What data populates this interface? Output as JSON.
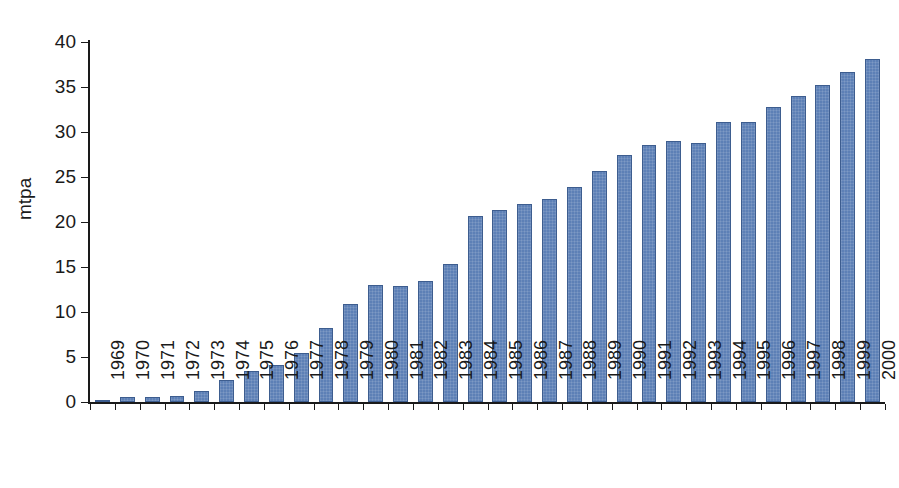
{
  "chart_data": {
    "type": "bar",
    "title": "",
    "subtitle": "",
    "xlabel": "",
    "ylabel": "mtpa",
    "ylim": [
      0,
      40
    ],
    "yticks": [
      0,
      5,
      10,
      15,
      20,
      25,
      30,
      35,
      40
    ],
    "ytick_labels": [
      "0",
      "5",
      "10",
      "15",
      "20",
      "25",
      "30",
      "35",
      "40"
    ],
    "grid": false,
    "legend": null,
    "legend_position": "none",
    "bar_color": "#5d80b6",
    "bar_edge_color": "#3d5d8f",
    "axis_color": "#1a1a1a",
    "background_color": "#ffffff",
    "categories": [
      "1969",
      "1970",
      "1971",
      "1972",
      "1973",
      "1974",
      "1975",
      "1976",
      "1977",
      "1978",
      "1979",
      "1980",
      "1981",
      "1982",
      "1983",
      "1984",
      "1985",
      "1986",
      "1987",
      "1988",
      "1989",
      "1990",
      "1991",
      "1992",
      "1993",
      "1994",
      "1995",
      "1996",
      "1997",
      "1998",
      "1999",
      "2000"
    ],
    "values": [
      0.2,
      0.6,
      0.6,
      0.7,
      1.2,
      2.5,
      3.4,
      4.1,
      5.5,
      8.2,
      10.9,
      13.0,
      12.9,
      13.4,
      15.3,
      20.7,
      21.3,
      22.0,
      22.6,
      23.9,
      25.7,
      27.4,
      28.6,
      29.0,
      28.8,
      31.1,
      31.1,
      32.8,
      34.0,
      35.2,
      36.7,
      38.1
    ]
  }
}
